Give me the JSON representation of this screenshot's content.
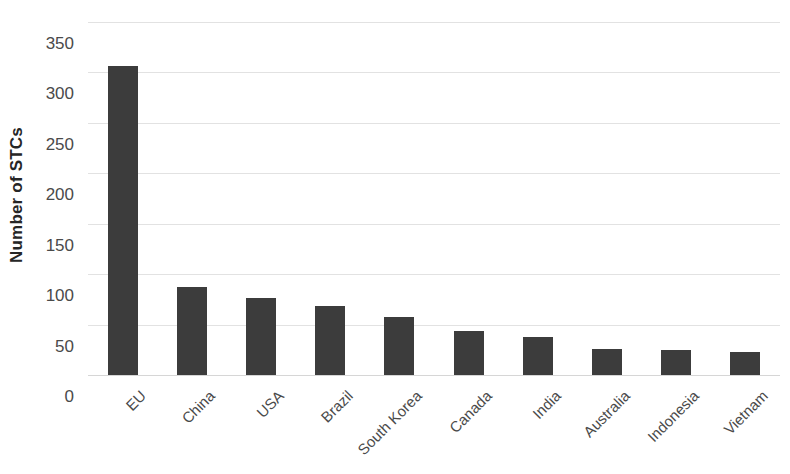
{
  "chart_data": {
    "type": "bar",
    "title": "",
    "xlabel": "",
    "ylabel": "Number of STCs",
    "categories": [
      "EU",
      "China",
      "USA",
      "Brazil",
      "South Korea",
      "Canada",
      "India",
      "Australia",
      "Indonesia",
      "Vietnam"
    ],
    "values": [
      306,
      87,
      76,
      68,
      58,
      44,
      38,
      26,
      25,
      23
    ],
    "series": [
      {
        "name": "Number of STCs",
        "values": [
          306,
          87,
          76,
          68,
          58,
          44,
          38,
          26,
          25,
          23
        ]
      }
    ],
    "ylim": [
      0,
      350
    ],
    "y_ticks": [
      0,
      50,
      100,
      150,
      200,
      250,
      300,
      350
    ],
    "y_tick_labels": [
      "0",
      "50",
      "100",
      "150",
      "200",
      "250",
      "300",
      "350"
    ],
    "grid": true,
    "grid_axis": "y",
    "legend": false,
    "legend_position": "none",
    "bar_color": "#3c3c3c",
    "grid_color": "#e2e2e2",
    "axis_text_color": "#4a4a4a",
    "background_color": "#ffffff",
    "x_tick_label_rotation": -45
  }
}
